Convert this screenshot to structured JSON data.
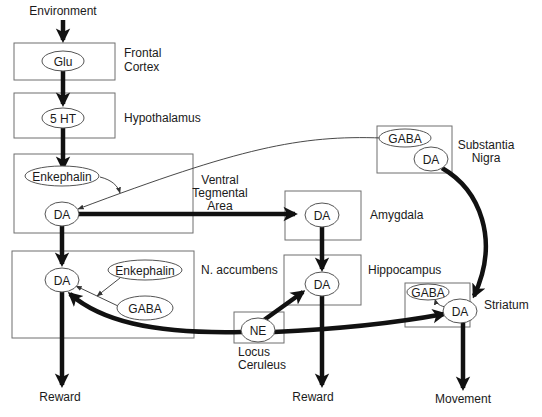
{
  "diagram": {
    "input_label": "Environment",
    "regions": [
      {
        "id": "frontal_cortex",
        "label_lines": [
          "Frontal",
          "Cortex"
        ]
      },
      {
        "id": "hypothalamus",
        "label_lines": [
          "Hypothalamus"
        ]
      },
      {
        "id": "vta",
        "label_lines": [
          "Ventral",
          "Tegmental",
          "Area"
        ]
      },
      {
        "id": "n_accumbens",
        "label_lines": [
          "N. accumbens"
        ]
      },
      {
        "id": "amygdala",
        "label_lines": [
          "Amygdala"
        ]
      },
      {
        "id": "hippocampus",
        "label_lines": [
          "Hippocampus"
        ]
      },
      {
        "id": "locus_ceruleus",
        "label_lines": [
          "Locus",
          "Ceruleus"
        ]
      },
      {
        "id": "substantia_nigra",
        "label_lines": [
          "Substantia",
          "Nigra"
        ]
      },
      {
        "id": "striatum",
        "label_lines": [
          "Striatum"
        ]
      }
    ],
    "nodes": {
      "fc_glu": "Glu",
      "hyp_5ht": "5 HT",
      "vta_enk": "Enkephalin",
      "vta_da": "DA",
      "nacc_da": "DA",
      "nacc_enk": "Enkephalin",
      "nacc_gaba": "GABA",
      "amy_da": "DA",
      "hip_da": "DA",
      "lc_ne": "NE",
      "sn_gaba": "GABA",
      "sn_da": "DA",
      "str_gaba": "GABA",
      "str_da": "DA"
    },
    "outputs": {
      "nacc_output": "Reward",
      "hip_output": "Reward",
      "str_output": "Movement"
    },
    "edges": [
      {
        "from": "Environment",
        "to": "fc_glu",
        "weight": "thick"
      },
      {
        "from": "fc_glu",
        "to": "hyp_5ht",
        "weight": "thick"
      },
      {
        "from": "hyp_5ht",
        "to": "vta_enk",
        "weight": "thick"
      },
      {
        "from": "vta_enk",
        "to": "vta_da",
        "weight": "thin"
      },
      {
        "from": "sn_gaba",
        "to": "vta_da",
        "weight": "thin"
      },
      {
        "from": "vta_da",
        "to": "amy_da",
        "weight": "thick"
      },
      {
        "from": "vta_da",
        "to": "nacc_da",
        "weight": "thick"
      },
      {
        "from": "nacc_enk",
        "to": "nacc_da",
        "weight": "thin"
      },
      {
        "from": "nacc_gaba",
        "to": "nacc_da",
        "weight": "thin"
      },
      {
        "from": "lc_ne",
        "to": "nacc_da",
        "weight": "thick"
      },
      {
        "from": "lc_ne",
        "to": "hip_da",
        "weight": "thick"
      },
      {
        "from": "lc_ne",
        "to": "str_da",
        "weight": "thick"
      },
      {
        "from": "amy_da",
        "to": "hip_da",
        "weight": "thick"
      },
      {
        "from": "sn_da",
        "to": "str_da",
        "weight": "thick"
      },
      {
        "from": "str_da",
        "to": "str_gaba",
        "weight": "thin"
      },
      {
        "from": "nacc_da",
        "to": "Reward",
        "weight": "thick"
      },
      {
        "from": "hip_da",
        "to": "Reward",
        "weight": "thick"
      },
      {
        "from": "str_da",
        "to": "Movement",
        "weight": "thick"
      }
    ],
    "colors": {
      "ink": "#111111",
      "box_stroke": "#6f6f6f",
      "background": "#ffffff"
    }
  }
}
